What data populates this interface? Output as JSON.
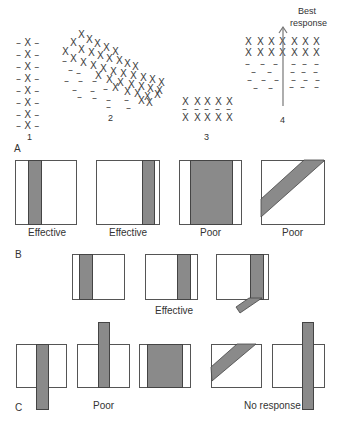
{
  "panel_a": {
    "label": "A",
    "groups": [
      {
        "id": "1",
        "label": "1"
      },
      {
        "id": "2",
        "label": "2"
      },
      {
        "id": "3",
        "label": "3"
      },
      {
        "id": "4",
        "label": "4",
        "arrow_label_1": "Best",
        "arrow_label_2": "response"
      }
    ],
    "group1_row": "– X –",
    "x_mark": "X",
    "dash_mark": "–"
  },
  "panel_b": {
    "label": "B",
    "boxes": [
      {
        "caption": "Effective"
      },
      {
        "caption": "Effective"
      },
      {
        "caption": "Poor"
      },
      {
        "caption": "Poor"
      }
    ],
    "row2_caption": "Effective"
  },
  "panel_c": {
    "label": "C",
    "caption_poor": "Poor",
    "caption_no_response": "No response"
  },
  "colors": {
    "band_fill": "#8a8a8a",
    "band_border": "#444444",
    "box_border": "#555555"
  }
}
